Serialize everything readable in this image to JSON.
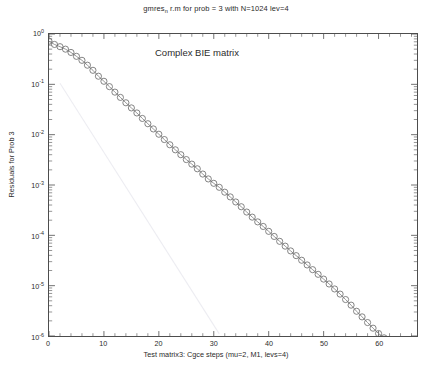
{
  "figure": {
    "title_prefix": "gmres",
    "title_sub": "n",
    "title_suffix": " r.m for prob = 3 with N=1024 lev=4",
    "annotation": "Complex BIE matrix",
    "background": "#ffffff",
    "axis_color": "#4d4d4d",
    "marker_color": "#6e6e6e",
    "line_color": "#8a8a8a",
    "reference_line_color": "#ededf2"
  },
  "chart_data": {
    "type": "line",
    "xlabel": "Test matrix3: Cgce steps (mu=2, M1, levs=4)",
    "ylabel": "Residuals for Prob 3",
    "yscale": "log",
    "xscale": "linear",
    "xlim": [
      0,
      67
    ],
    "ylim": [
      1e-06,
      1
    ],
    "grid": false,
    "legend": false,
    "xticks": [
      0,
      10,
      20,
      30,
      40,
      50,
      60
    ],
    "xticklabels": [
      "0",
      "10",
      "20",
      "30",
      "40",
      "50",
      "60"
    ],
    "yticks": [
      1,
      0.1,
      0.01,
      0.001,
      0.0001,
      1e-05,
      1e-06
    ],
    "yticklabels": [
      "10^0",
      "10^-1",
      "10^-2",
      "10^-3",
      "10^-4",
      "10^-5",
      "10^-6"
    ],
    "yticklabel_exponents": [
      "0",
      "-1",
      "-2",
      "-3",
      "-4",
      "-5",
      "-6"
    ],
    "series": [
      {
        "name": "Complex BIE matrix residual",
        "marker": "o",
        "linestyle": "-",
        "x": [
          0,
          1,
          2,
          3,
          4,
          5,
          6,
          7,
          8,
          9,
          10,
          11,
          12,
          13,
          14,
          15,
          16,
          17,
          18,
          19,
          20,
          21,
          22,
          23,
          24,
          25,
          26,
          27,
          28,
          29,
          30,
          31,
          32,
          33,
          34,
          35,
          36,
          37,
          38,
          39,
          40,
          41,
          42,
          43,
          44,
          45,
          46,
          47,
          48,
          49,
          50,
          51,
          52,
          53,
          54,
          55,
          56,
          57,
          58,
          59,
          60,
          61,
          62
        ],
        "y": [
          0.72,
          0.62,
          0.56,
          0.5,
          0.43,
          0.36,
          0.3,
          0.24,
          0.19,
          0.145,
          0.115,
          0.09,
          0.07,
          0.055,
          0.043,
          0.034,
          0.027,
          0.021,
          0.0165,
          0.013,
          0.0102,
          0.008,
          0.0063,
          0.005,
          0.004,
          0.0032,
          0.0026,
          0.0021,
          0.00165,
          0.00132,
          0.00108,
          0.0009,
          0.00072,
          0.00058,
          0.00046,
          0.00037,
          0.00029,
          0.00023,
          0.000185,
          0.00015,
          0.00012,
          9.5e-05,
          7.6e-05,
          6.1e-05,
          4.9e-05,
          3.95e-05,
          3.2e-05,
          2.58e-05,
          2.08e-05,
          1.68e-05,
          1.35e-05,
          1.08e-05,
          8.6e-06,
          6.8e-06,
          5.3e-06,
          4.1e-06,
          3.1e-06,
          2.4e-06,
          1.85e-06,
          1.43e-06,
          1.12e-06,
          9.2e-07,
          7.8e-07
        ]
      },
      {
        "name": "reference slope line",
        "marker": "none",
        "linestyle": "-",
        "faint": true,
        "x": [
          2,
          31
        ],
        "y": [
          0.105,
          1.1e-06
        ]
      }
    ]
  },
  "axis_labels": {
    "x": "Test matrix3: Cgce steps (mu=2, M1, levs=4)",
    "y": "Residuals for Prob 3"
  }
}
